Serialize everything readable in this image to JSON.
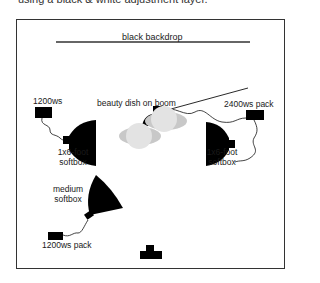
{
  "caption": "using a black & white adjustment layer.",
  "diagram": {
    "backdrop": {
      "label": "black backdrop"
    },
    "beauty_dish": {
      "label": "beauty dish on boom"
    },
    "pack_right": {
      "label": "2400ws pack"
    },
    "pack_left": {
      "label": "1200ws"
    },
    "softbox_left": {
      "label_line1": "1x6-foot",
      "label_line2": "softbox"
    },
    "softbox_right": {
      "label_line1": "1x6-foot",
      "label_line2": "softbox"
    },
    "softbox_medium": {
      "label_line1": "medium",
      "label_line2": "softbox"
    },
    "pack_bottom": {
      "label": "1200ws pack"
    },
    "subject": {
      "icon": "subject-figures"
    },
    "camera": {
      "icon": "camera-icon"
    },
    "colors": {
      "ink": "#000000",
      "frame": "#333333",
      "subject_light": "#e3e3e3",
      "subject_dark": "#c8c8c8"
    }
  }
}
